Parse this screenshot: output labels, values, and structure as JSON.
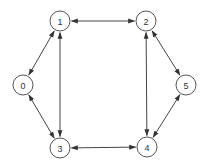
{
  "diagram": {
    "type": "undirected-graph-bidirectional-arrows",
    "nodes": [
      {
        "id": "0",
        "label": "0",
        "x": 23,
        "y": 85
      },
      {
        "id": "1",
        "label": "1",
        "x": 60,
        "y": 21
      },
      {
        "id": "2",
        "label": "2",
        "x": 146,
        "y": 21
      },
      {
        "id": "3",
        "label": "3",
        "x": 60,
        "y": 148
      },
      {
        "id": "4",
        "label": "4",
        "x": 147,
        "y": 147
      },
      {
        "id": "5",
        "label": "5",
        "x": 186,
        "y": 85
      }
    ],
    "edges": [
      {
        "from": "0",
        "to": "1",
        "bidirectional": true
      },
      {
        "from": "0",
        "to": "3",
        "bidirectional": true
      },
      {
        "from": "1",
        "to": "2",
        "bidirectional": true
      },
      {
        "from": "1",
        "to": "3",
        "bidirectional": true
      },
      {
        "from": "2",
        "to": "4",
        "bidirectional": true
      },
      {
        "from": "2",
        "to": "5",
        "bidirectional": true
      },
      {
        "from": "3",
        "to": "4",
        "bidirectional": true
      },
      {
        "from": "4",
        "to": "5",
        "bidirectional": true
      }
    ],
    "node_radius": 10,
    "colors": {
      "stroke": "#444444",
      "background": "#ffffff",
      "text": "#333333"
    }
  }
}
